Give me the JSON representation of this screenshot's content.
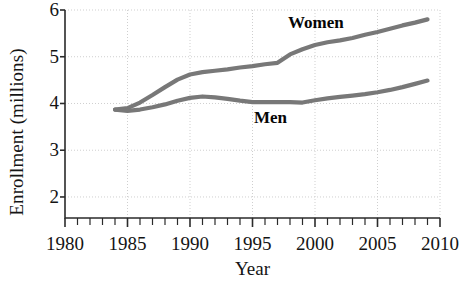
{
  "chart_data": {
    "type": "line",
    "title": "",
    "subtitle": "",
    "xlabel": "Year",
    "ylabel": "Enrollment (millions)",
    "xlim": [
      1980,
      2010
    ],
    "ylim": [
      1.55,
      6.0
    ],
    "y_axis_visible_min": 2,
    "y_axis_visible_max": 6,
    "grid": true,
    "grid_style": "dotted light gray, horizontal at integer y ticks and vertical at 5-year x ticks",
    "legend": "inline labels next to curves",
    "x_major_ticks": [
      1980,
      1985,
      1990,
      1995,
      2000,
      2005,
      2010
    ],
    "x_major_tick_labels": [
      "1980",
      "1985",
      "1990",
      "1995",
      "2000",
      "2005",
      "2010"
    ],
    "x_minor_tick_interval": 1,
    "y_ticks": [
      2,
      3,
      4,
      5,
      6
    ],
    "y_tick_labels": [
      "2",
      "3",
      "4",
      "5",
      "6"
    ],
    "x": [
      1984,
      1985,
      1986,
      1987,
      1988,
      1989,
      1990,
      1991,
      1992,
      1993,
      1994,
      1995,
      1996,
      1997,
      1998,
      1999,
      2000,
      2001,
      2002,
      2003,
      2004,
      2005,
      2006,
      2007,
      2008,
      2009
    ],
    "series": [
      {
        "name": "Women",
        "label": "Women",
        "color": "#787878",
        "values": [
          3.87,
          3.9,
          4.02,
          4.18,
          4.35,
          4.51,
          4.62,
          4.67,
          4.7,
          4.73,
          4.77,
          4.8,
          4.84,
          4.87,
          5.05,
          5.16,
          5.25,
          5.31,
          5.35,
          5.4,
          5.47,
          5.53,
          5.6,
          5.67,
          5.73,
          5.8
        ]
      },
      {
        "name": "Men",
        "label": "Men",
        "color": "#787878",
        "values": [
          3.87,
          3.84,
          3.87,
          3.92,
          3.98,
          4.06,
          4.12,
          4.15,
          4.13,
          4.1,
          4.06,
          4.03,
          4.03,
          4.03,
          4.03,
          4.02,
          4.07,
          4.11,
          4.14,
          4.17,
          4.2,
          4.24,
          4.29,
          4.35,
          4.42,
          4.49
        ]
      }
    ]
  },
  "annotations": {
    "women_label": "Women",
    "men_label": "Men"
  },
  "colors": {
    "line": "#787878",
    "axis": "#2b2b2b",
    "grid": "#cfcfcf",
    "text": "#141414",
    "background": "#ffffff"
  }
}
